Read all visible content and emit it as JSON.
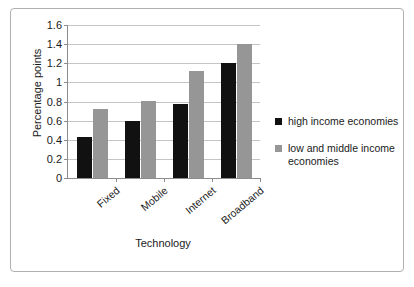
{
  "chart_data": {
    "type": "bar",
    "title": "",
    "xlabel": "Technology",
    "ylabel": "Percentage points",
    "categories": [
      "Fixed",
      "Mobile",
      "Internet",
      "Broadband"
    ],
    "series": [
      {
        "name": "high income economies",
        "color": "#111111",
        "values": [
          0.43,
          0.6,
          0.77,
          1.2
        ]
      },
      {
        "name": "low and middle income economies",
        "color": "#969696",
        "values": [
          0.72,
          0.81,
          1.12,
          1.4
        ]
      }
    ],
    "ylim": [
      0,
      1.6
    ],
    "ytick_step": 0.2,
    "yticks": [
      "0",
      "0.2",
      "0.4",
      "0.6",
      "0.8",
      "1",
      "1.2",
      "1.4",
      "1.6"
    ],
    "grid": true,
    "legend_position": "right",
    "frame_border": true
  }
}
